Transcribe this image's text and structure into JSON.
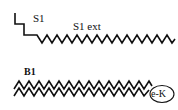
{
  "diagram": {
    "labels": {
      "s1": "S1",
      "s1_ext": "S1 ext",
      "b1": "B1",
      "ek": "e-K"
    },
    "colors": {
      "stroke": "#111111",
      "background": "#ffffff"
    }
  }
}
